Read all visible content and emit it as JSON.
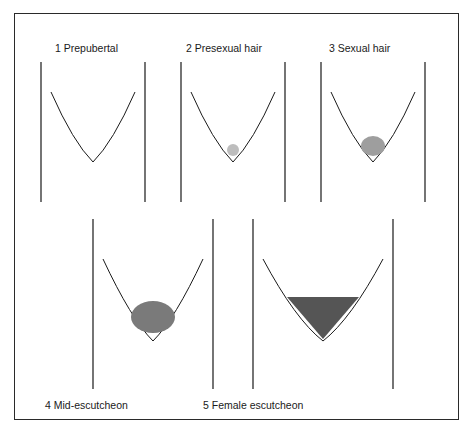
{
  "figure": {
    "stages": [
      {
        "number": "1",
        "label": "1  Prepubertal",
        "density": 0
      },
      {
        "number": "2",
        "label": "2  Presexual hair",
        "density": 1
      },
      {
        "number": "3",
        "label": "3  Sexual hair",
        "density": 2
      },
      {
        "number": "4",
        "label": "4  Mid-escutcheon",
        "density": 3
      },
      {
        "number": "5",
        "label": "5  Female escutcheon",
        "density": 4
      }
    ],
    "line_color": "#1a1a1a",
    "border_color": "#2a2a2a"
  }
}
